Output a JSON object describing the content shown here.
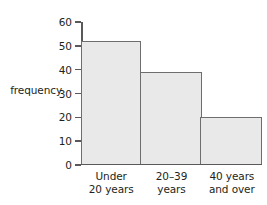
{
  "chart_data": {
    "type": "bar",
    "title": "",
    "xlabel": "",
    "ylabel": "frequency",
    "categories": [
      "Under 20 years",
      "20–39 years",
      "40 years and over"
    ],
    "category_lines": [
      [
        "Under",
        "20 years"
      ],
      [
        "20–39",
        "years"
      ],
      [
        "40 years",
        "and over"
      ]
    ],
    "values": [
      52,
      39,
      20
    ],
    "ylim": [
      0,
      60
    ],
    "ytick_values": [
      0,
      10,
      20,
      30,
      40,
      50,
      60
    ],
    "ytick_labels": [
      "0",
      "10",
      "20",
      "30",
      "40",
      "50",
      "60"
    ],
    "grid": false,
    "legend": "none",
    "bar_fill_color": "#e9e9e9",
    "bar_border_color": "#6d6e70",
    "axis_color": "#58595b",
    "text_color": "#231f20",
    "background_color": "#ffffff"
  }
}
